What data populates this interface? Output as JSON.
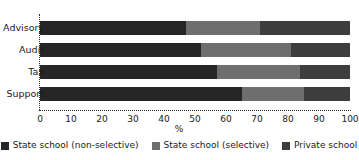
{
  "chart_data": {
    "type": "bar",
    "orientation": "horizontal",
    "stacked": true,
    "stack_total": 100,
    "title": "",
    "xlabel": "%",
    "ylabel": "",
    "xlim": [
      0,
      100
    ],
    "grid": false,
    "legend_position": "bottom",
    "categories": [
      "Advisory",
      "Audit",
      "Tax",
      "Support"
    ],
    "xticks": [
      0,
      10,
      20,
      30,
      40,
      50,
      60,
      70,
      80,
      90,
      100
    ],
    "xtick_labels": [
      "0",
      "10",
      "20",
      "30",
      "40",
      "50",
      "60",
      "70",
      "80",
      "90",
      "100"
    ],
    "series": [
      {
        "name": "State school (non-selective)",
        "color": "#262626",
        "values": [
          47,
          52,
          57,
          65
        ]
      },
      {
        "name": "State school (selective)",
        "color": "#6e6e6e",
        "values": [
          24,
          29,
          27,
          20
        ]
      },
      {
        "name": "Private school",
        "color": "#3d3d3d",
        "values": [
          29,
          19,
          16,
          15
        ]
      }
    ]
  },
  "axis": {
    "x_title": "%"
  }
}
